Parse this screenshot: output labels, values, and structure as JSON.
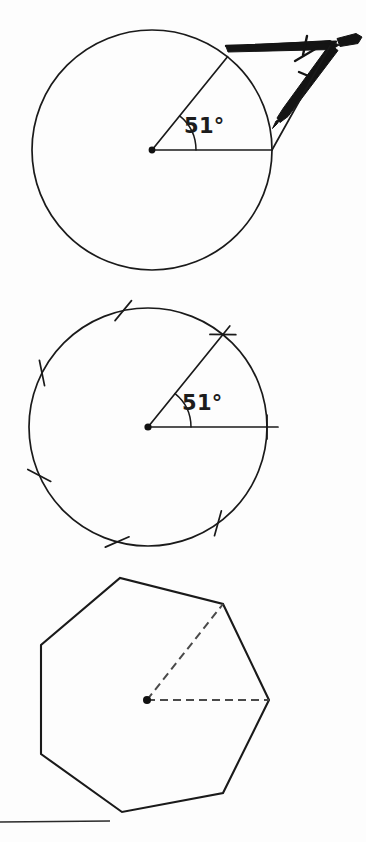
{
  "document": {
    "kind": "geometry-construction-figure",
    "background_color": "#fdfdfd",
    "ink_color": "#1a1a1a",
    "width": 366,
    "height": 842
  },
  "panels": [
    {
      "id": "panel-compass-angle",
      "name": "circle-with-compass-measuring-angle",
      "caption": "",
      "center": {
        "x": 152,
        "y": 150
      },
      "radius": 120,
      "angle_label": "51°",
      "angle_value": 51,
      "angle_unit": "degrees",
      "arc_label_position": {
        "x": 192,
        "y": 133
      },
      "radii": [
        {
          "name": "horizontal-radius",
          "angle_deg": 0
        },
        {
          "name": "angled-radius",
          "angle_deg": 51
        }
      ],
      "instrument": {
        "name": "compass",
        "label": "compass",
        "color": "#141414"
      }
    },
    {
      "id": "panel-stepped-circle",
      "name": "circle-with-seven-step-marks",
      "caption": "",
      "center": {
        "x": 148,
        "y": 427
      },
      "radius": 119,
      "angle_label": "51°",
      "angle_value": 51,
      "angle_unit": "degrees",
      "arc_label_position": {
        "x": 190,
        "y": 410
      },
      "tick_count": 7,
      "tick_angles_deg": [
        0,
        51,
        102,
        153,
        204,
        255,
        306
      ],
      "radii": [
        {
          "name": "horizontal-radius",
          "angle_deg": 0
        },
        {
          "name": "angled-radius",
          "angle_deg": 51
        }
      ]
    },
    {
      "id": "panel-heptagon",
      "name": "regular-heptagon-with-dashed-radii",
      "caption": "",
      "center": {
        "x": 147,
        "y": 700
      },
      "circumradius": 122,
      "sides": 7,
      "rotation_deg": 0,
      "vertices": [
        {
          "x": 269,
          "y": 700
        },
        {
          "x": 223,
          "y": 604
        },
        {
          "x": 120,
          "y": 578
        },
        {
          "x": 41,
          "y": 645
        },
        {
          "x": 41,
          "y": 754
        },
        {
          "x": 122,
          "y": 812
        },
        {
          "x": 223,
          "y": 793
        }
      ],
      "dashed_radii": [
        {
          "name": "dashed-radius-horizontal",
          "to_vertex": 0
        },
        {
          "name": "dashed-radius-upper-right",
          "to_vertex": 1
        }
      ]
    }
  ],
  "footer": {
    "rule": {
      "name": "bottom-rule-line",
      "x1": 0,
      "y1": 822,
      "x2": 110,
      "y2": 821
    }
  }
}
